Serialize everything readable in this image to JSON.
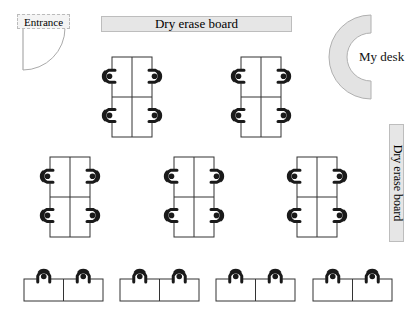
{
  "room": {
    "width": 419,
    "height": 319,
    "background": "#ffffff"
  },
  "entrance": {
    "label": "Entrance",
    "box": {
      "x": 17,
      "y": 14,
      "w": 53,
      "h": 15
    },
    "door": {
      "hinge_x": 23,
      "hinge_y": 70,
      "radius": 42
    }
  },
  "boards": {
    "top": {
      "label": "Dry erase board",
      "x": 101,
      "y": 16,
      "w": 191,
      "h": 16
    },
    "right": {
      "label": "Dry erase board",
      "x": 389,
      "y": 124,
      "w": 15,
      "h": 118
    }
  },
  "teacher_desk": {
    "label": "My desk",
    "cx": 371,
    "cy": 57,
    "outer_r": 42,
    "inner_r": 24,
    "fill": "#e3e3e3",
    "stroke": "#b0b0b0"
  },
  "colors": {
    "desk_stroke": "#333333",
    "chair": "#1a1a1a"
  },
  "clusters": [
    {
      "name": "cluster-top-left",
      "x": 112,
      "y": 57,
      "w": 40,
      "h": 80
    },
    {
      "name": "cluster-top-right",
      "x": 241,
      "y": 57,
      "w": 40,
      "h": 80
    },
    {
      "name": "cluster-middle-left",
      "x": 50,
      "y": 157,
      "w": 40,
      "h": 80
    },
    {
      "name": "cluster-middle-center",
      "x": 174,
      "y": 157,
      "w": 40,
      "h": 80
    },
    {
      "name": "cluster-middle-right",
      "x": 297,
      "y": 157,
      "w": 40,
      "h": 80
    }
  ],
  "desk_pairs": [
    {
      "name": "front-pair-1",
      "x": 24,
      "y": 279,
      "w": 79,
      "h": 22
    },
    {
      "name": "front-pair-2",
      "x": 120,
      "y": 279,
      "w": 79,
      "h": 22
    },
    {
      "name": "front-pair-3",
      "x": 216,
      "y": 279,
      "w": 79,
      "h": 22
    },
    {
      "name": "front-pair-4",
      "x": 313,
      "y": 279,
      "w": 79,
      "h": 22
    }
  ],
  "counts": {
    "clusters": 5,
    "seats_per_cluster": 4,
    "desk_pairs": 4,
    "seats_per_pair": 2,
    "total_seats": 28
  }
}
